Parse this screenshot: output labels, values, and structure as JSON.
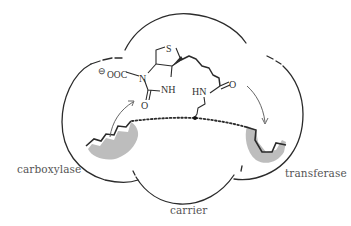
{
  "diagram": {
    "type": "enzyme-complex-schematic",
    "subunits": [
      {
        "id": "carboxylase",
        "label": "carboxylase"
      },
      {
        "id": "carrier",
        "label": "carrier"
      },
      {
        "id": "transferase",
        "label": "transferase"
      }
    ],
    "molecule": {
      "name": "carboxybiotin",
      "atoms": {
        "sulfur": "S",
        "carboxylate": "OOC",
        "charge": "⊖",
        "ring_n": "N",
        "ring_nh": "NH",
        "carbonyl_o": "O",
        "amide_hn": "HN",
        "amide_o": "O"
      }
    },
    "colors": {
      "line": "#2b2b2b",
      "active_site_fill": "#bdbdbd",
      "label": "#555555"
    }
  }
}
